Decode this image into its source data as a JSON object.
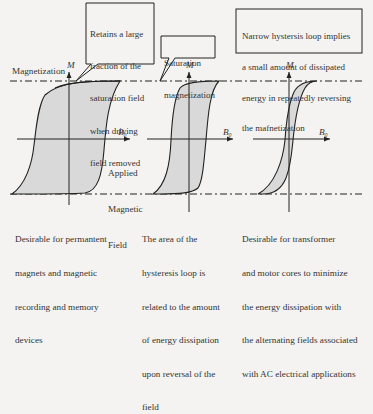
{
  "callouts": {
    "remanence": {
      "lines": [
        "Retains a large",
        "fraction of the",
        "saturation field",
        "when driving",
        "field removed"
      ]
    },
    "saturation": {
      "lines": [
        "Saturation",
        "magnetization"
      ]
    },
    "narrow_loop": {
      "lines": [
        "Narrow hystersis loop implies",
        "a small amount of dissipated",
        "energy in repeatedly reversing",
        "the mafnetization"
      ]
    }
  },
  "labels": {
    "magnetization": "Magnetization",
    "m_axis": "M",
    "b0_axis": "B₀",
    "applied_field": [
      "Applied",
      "Magnetic",
      "Field"
    ]
  },
  "captions": {
    "left": [
      "Desirable for permantent",
      "magnets and magnetic",
      "recording and memory",
      "devices"
    ],
    "middle": [
      "The area of the",
      "hysteresis loop is",
      "related to the amount",
      "of energy dissipation",
      "upon reversal of the",
      "field"
    ],
    "right": [
      "Desirable for transformer",
      "and motor cores to minimize",
      "the energy dissipation with",
      "the alternating fields associated",
      "with AC electrical applications"
    ]
  },
  "colors": {
    "loop_fill": "#d9d9d9",
    "line": "#222222",
    "background": "#f4f3f1"
  }
}
